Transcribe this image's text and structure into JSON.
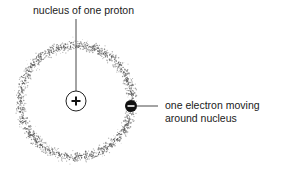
{
  "diagram": {
    "labels": {
      "nucleus": "nucleus of one proton",
      "electron_line1": "one electron moving",
      "electron_line2": "around nucleus"
    },
    "symbols": {
      "nucleus_sign": "+",
      "electron_sign": "−"
    },
    "geometry": {
      "center": [
        76,
        101
      ],
      "nucleus_radius": 10,
      "electron_center": [
        131,
        106
      ],
      "electron_radius": 6,
      "orbit_radius": 56,
      "orbit_inner": 45,
      "orbit_outer": 66
    },
    "colors": {
      "ink": "#1a1a1a",
      "cloud": "#555555",
      "background": "#ffffff"
    }
  }
}
